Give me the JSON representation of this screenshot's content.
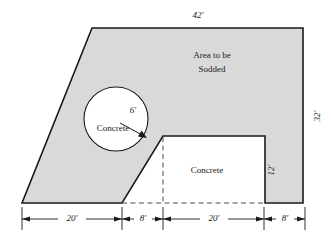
{
  "figure": {
    "name": "sodded-area-with-concrete-regions",
    "units": "feet",
    "colors": {
      "sod_fill": "#d9d9d9",
      "concrete_fill": "#ffffff",
      "outline": "#1a1a1a",
      "dimension_line": "#1a1a1a",
      "background": "#ffffff"
    },
    "labels": {
      "sodded_area_line1": "Area to be",
      "sodded_area_line2": "Sodded",
      "circle_concrete": "Concrete",
      "rect_concrete": "Concrete",
      "circle_radius": "6′"
    },
    "dimensions": {
      "top_width": "42′",
      "right_height": "32′",
      "notch_height": "12′",
      "bottom_segments": [
        {
          "label": "20′",
          "value": 20
        },
        {
          "label": "8′",
          "value": 8
        },
        {
          "label": "20′",
          "value": 20
        },
        {
          "label": "8′",
          "value": 8
        }
      ]
    },
    "geometry": {
      "outer_polygon_points": "92,28 303,28 303,203 265,203 265,136 163,136 122,203 22,203",
      "circle": {
        "cx": 116,
        "cy": 119,
        "r": 32
      },
      "radius_arrow": {
        "x1": 120,
        "y1": 123,
        "x2": 146,
        "y2": 137
      },
      "notch_rect": {
        "x": 163,
        "y": 136,
        "w": 102,
        "h": 67
      }
    }
  }
}
